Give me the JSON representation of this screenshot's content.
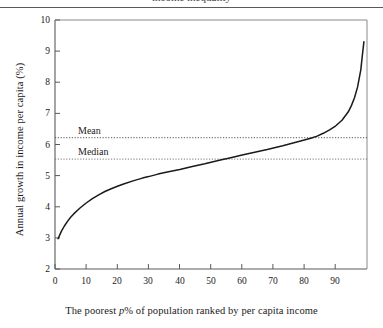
{
  "figure": {
    "header_clipped_text": "income inequality",
    "background_color": "#ffffff",
    "line_color": "#1a1a1a",
    "axis_color": "#5a5a5a",
    "reference_line_color": "#555555"
  },
  "axis_titles": {
    "y": "Annual growth in income per capita (%)",
    "x_before_italic": "The poorest ",
    "x_italic": "p",
    "x_after_italic": "% of population ranked by per capita income"
  },
  "reference_labels": {
    "mean": "Mean",
    "median": "Median"
  },
  "chart_data": {
    "type": "line",
    "title": "",
    "subtitle": "",
    "xlabel": "The poorest p% of population ranked by per capita income",
    "ylabel": "Annual growth in income per capita (%)",
    "xlim": [
      0,
      100
    ],
    "ylim": [
      2,
      10
    ],
    "xticks": [
      0,
      10,
      20,
      30,
      40,
      50,
      60,
      70,
      80,
      90
    ],
    "yticks": [
      2,
      3,
      4,
      5,
      6,
      7,
      8,
      9,
      10
    ],
    "grid": false,
    "legend": "none",
    "series": [
      {
        "name": "Annual growth in income per capita",
        "x": [
          1,
          2,
          3,
          4,
          5,
          6,
          8,
          10,
          12,
          14,
          16,
          18,
          20,
          22,
          25,
          28,
          30,
          33,
          36,
          40,
          44,
          48,
          50,
          53,
          56,
          60,
          64,
          68,
          70,
          73,
          76,
          79,
          82,
          84,
          86,
          88,
          90,
          92,
          94,
          95,
          96,
          97,
          98,
          98.5,
          99
        ],
        "y": [
          2.97,
          3.2,
          3.38,
          3.53,
          3.66,
          3.77,
          3.96,
          4.12,
          4.26,
          4.38,
          4.49,
          4.58,
          4.66,
          4.73,
          4.83,
          4.92,
          4.97,
          5.05,
          5.12,
          5.2,
          5.29,
          5.38,
          5.43,
          5.5,
          5.57,
          5.66,
          5.75,
          5.84,
          5.89,
          5.96,
          6.04,
          6.12,
          6.2,
          6.27,
          6.36,
          6.47,
          6.6,
          6.78,
          7.05,
          7.25,
          7.5,
          7.85,
          8.4,
          8.85,
          9.3
        ]
      }
    ],
    "reference_lines": [
      {
        "label": "Mean",
        "value": 6.22,
        "style": "dotted",
        "orientation": "horizontal"
      },
      {
        "label": "Median",
        "value": 5.53,
        "style": "dotted",
        "orientation": "horizontal"
      }
    ],
    "annotations": [
      {
        "text": "Mean",
        "x": 10,
        "y": 6.6
      },
      {
        "text": "Median",
        "x": 10,
        "y": 5.9
      }
    ]
  },
  "ticks": {
    "y": [
      "10",
      "9",
      "8",
      "7",
      "6",
      "5",
      "4",
      "3",
      "2"
    ],
    "x": [
      "0",
      "10",
      "20",
      "30",
      "40",
      "50",
      "60",
      "70",
      "80",
      "90"
    ]
  }
}
